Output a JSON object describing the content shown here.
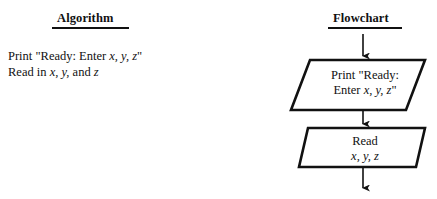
{
  "page": {
    "background_color": "#ffffff",
    "ink_color": "#111111"
  },
  "columns": {
    "algorithm": {
      "heading": "Algorithm",
      "lines": [
        {
          "prefix": "Print \"Ready: Enter ",
          "vars": "x, y, z",
          "suffix": "\""
        },
        {
          "prefix": "Read in ",
          "vars": "x, y,",
          "mid": " and ",
          "vars2": "z",
          "suffix": ""
        }
      ],
      "line1_text": "Print \"Ready: Enter x, y, z\"",
      "line2_text": "Read in x, y, and z"
    },
    "flowchart": {
      "heading": "Flowchart",
      "nodes": [
        {
          "id": "print-node",
          "shape": "parallelogram",
          "semantic": "input-output",
          "line1": "Print \"Ready:",
          "line2": "Enter x, y, z\"",
          "line2_prefix": "Enter ",
          "line2_vars": "x, y, z",
          "line2_suffix": "\""
        },
        {
          "id": "read-node",
          "shape": "parallelogram",
          "semantic": "input-output",
          "line1": "Read",
          "line2": "x, y, z",
          "line2_prefix": "",
          "line2_vars": "x, y, z",
          "line2_suffix": ""
        }
      ],
      "connectors": [
        {
          "id": "connector-top",
          "from": "flowchart-heading",
          "to": "print-node"
        },
        {
          "id": "connector-middle",
          "from": "print-node",
          "to": "read-node"
        },
        {
          "id": "connector-bottom",
          "from": "read-node",
          "to": "next"
        }
      ]
    }
  }
}
